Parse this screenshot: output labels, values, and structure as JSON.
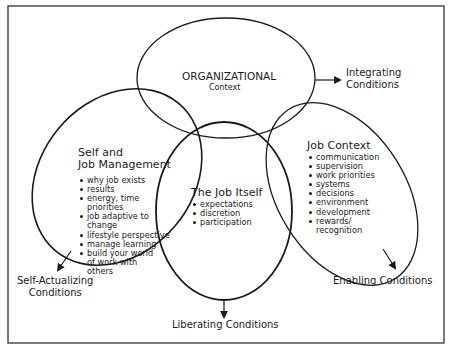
{
  "organizational": {
    "title": "ORGANIZATIONAL",
    "subtitle": "Context"
  },
  "self_management": {
    "title_line1": "Self and",
    "title_line2": "Job Management",
    "items": [
      [
        "why job exists"
      ],
      [
        "results"
      ],
      [
        "energy, time",
        "priorities"
      ],
      [
        "job adaptive to",
        "change"
      ],
      [
        "lifestyle perspective"
      ],
      [
        "manage learning"
      ],
      [
        "build your world",
        "of work with",
        "others"
      ]
    ]
  },
  "job_itself": {
    "title": "The Job Itself",
    "items": [
      "expectations",
      "discretion",
      "participation"
    ]
  },
  "job_context": {
    "title": "Job Context",
    "items": [
      [
        "communication"
      ],
      [
        "supervision"
      ],
      [
        "work priorities"
      ],
      [
        "systems"
      ],
      [
        "decisions"
      ],
      [
        "environment"
      ],
      [
        "development"
      ],
      [
        "rewards/",
        "recognition"
      ]
    ]
  },
  "conditions": {
    "integrating_line1": "Integrating",
    "integrating_line2": "Conditions",
    "self_actualizing_line1": "Self-Actualizing",
    "self_actualizing_line2": "Conditions",
    "liberating": "Liberating Conditions",
    "enabling": "Enabling Conditions"
  },
  "colors": {
    "stroke": "#1a1a1a",
    "background": "#ffffff",
    "frame": "#333333"
  }
}
